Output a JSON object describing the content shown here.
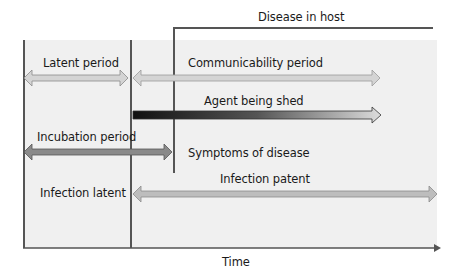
{
  "diagram": {
    "header_label": "Disease in host",
    "axis_label": "Time",
    "labels": {
      "latent_period": "Latent period",
      "communicability_period": "Communicability period",
      "agent_being_shed": "Agent being shed",
      "incubation_period": "Incubation period",
      "symptoms_of_disease": "Symptoms of disease",
      "infection_latent": "Infection latent",
      "infection_patent": "Infection patent"
    },
    "colors": {
      "background_panel": "#f0f0f0",
      "light_arrow": "#d4d4d4",
      "dark_arrow": "#8a8a8a",
      "shed_gradient_start": "#111111",
      "shed_gradient_end": "#dcdcdc",
      "lines": "#555555"
    }
  }
}
